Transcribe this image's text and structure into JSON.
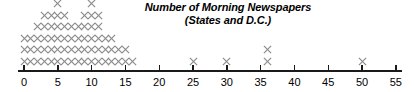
{
  "chart_data": {
    "type": "scatter",
    "plot_style": "dot-plot-stacked-x",
    "title": "Number of Morning Newspapers",
    "subtitle": "(States and D.C.)",
    "xlabel": "",
    "ylabel": "",
    "xlim": [
      0,
      55
    ],
    "grid": false,
    "legend": null,
    "marker": "x",
    "marker_color": "#8a8a8a",
    "axis_color": "#1a1a1a",
    "tick_values": [
      0,
      5,
      10,
      15,
      20,
      25,
      30,
      35,
      40,
      45,
      50,
      55
    ],
    "tick_labels": [
      "0",
      "5",
      "10",
      "15",
      "20",
      "25",
      "30",
      "35",
      "40",
      "45",
      "50",
      "55"
    ],
    "tick_interval": 5,
    "x": [
      0,
      1,
      2,
      3,
      4,
      5,
      6,
      7,
      8,
      9,
      10,
      11,
      12,
      13,
      14,
      15,
      16,
      25,
      30,
      36,
      50
    ],
    "counts": [
      3,
      3,
      4,
      5,
      5,
      6,
      5,
      4,
      4,
      5,
      6,
      5,
      3,
      3,
      2,
      2,
      1,
      1,
      1,
      2,
      1
    ],
    "total_observations": 71,
    "max_stack_height": 6
  },
  "axis": {
    "origin_px": 24,
    "px_per_unit": 6.76,
    "baseline_px": 70
  }
}
